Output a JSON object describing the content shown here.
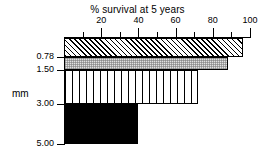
{
  "chart_data": {
    "type": "bar",
    "orientation": "horizontal",
    "title": "% survival at 5 years",
    "xlabel": "% survival at 5 years",
    "ylabel": "mm",
    "xlim": [
      0,
      100
    ],
    "ylim_labels": [
      "0.78",
      "1.50",
      "3.00",
      "5.00"
    ],
    "xaxis_position": "top",
    "grid": false,
    "legend": false,
    "major_ticks": [
      20,
      40,
      60,
      80,
      100
    ],
    "minor_ticks": [
      10,
      30,
      50,
      70,
      90
    ],
    "tick_labels": [
      "20",
      "40",
      "60",
      "80",
      "100"
    ],
    "y_boundary_labels": [
      "0.78",
      "1.50",
      "3.00",
      "5.00"
    ],
    "categories": [
      "<0.78",
      "0.78-1.50",
      "1.50-3.00",
      "3.00-5.00"
    ],
    "values": [
      96,
      88,
      72,
      40
    ],
    "fills": [
      "diagonal-hatch",
      "gray-dots",
      "vertical-stripes",
      "solid-black"
    ]
  },
  "axes": {
    "y_axis_title": "mm",
    "y_labels": [
      {
        "text": "0.78"
      },
      {
        "text": "1.50"
      },
      {
        "text": "3.00"
      },
      {
        "text": "5.00"
      }
    ]
  }
}
